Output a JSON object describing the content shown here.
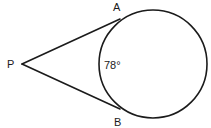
{
  "figure": {
    "background_color": "#ffffff",
    "stroke_color": "#1b1b1b",
    "width": 211,
    "height": 128
  },
  "chart_data": {
    "type": "diagram",
    "subtype": "euclidean-geometry",
    "background": "#ffffff",
    "stroke_color": "#1b1b1b",
    "circle": {
      "center_x": 153,
      "center_y": 64,
      "radius": 54,
      "stroke_width": 1.6
    },
    "points": [
      {
        "name": "P",
        "x": 22,
        "y": 64,
        "role": "external-vertex"
      },
      {
        "name": "A",
        "x": 120,
        "y": 19,
        "role": "tangent-point-upper"
      },
      {
        "name": "B",
        "x": 120,
        "y": 109,
        "role": "tangent-point-lower"
      }
    ],
    "segments": [
      {
        "name": "PA",
        "from": "P",
        "to": "A",
        "stroke_width": 1.6
      },
      {
        "name": "PB",
        "from": "P",
        "to": "B",
        "stroke_width": 1.6
      }
    ],
    "angles": [
      {
        "name": "arc-AB-minor",
        "value": 78,
        "unit": "degrees",
        "label": "78°"
      }
    ]
  },
  "labels": {
    "point_p": "P",
    "point_a": "A",
    "point_b": "B",
    "angle_measure": "78°"
  },
  "label_positions": {
    "point_p": {
      "x": 7,
      "y": 68
    },
    "point_a": {
      "x": 113,
      "y": 11
    },
    "point_b": {
      "x": 114,
      "y": 126
    },
    "angle_measure": {
      "x": 104,
      "y": 69
    }
  }
}
